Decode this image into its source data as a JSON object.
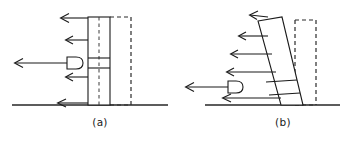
{
  "figure": {
    "background_color": "#ffffff",
    "line_color": "#1a1a1a",
    "width": 360,
    "height": 147
  },
  "panels": [
    {
      "id": "a",
      "caption": "(a)",
      "caption_x": 100,
      "caption_y": 126,
      "state_label": "undeformed",
      "ground": {
        "x1": 12,
        "x2": 168,
        "y": 105
      },
      "column": {
        "left": 88,
        "right": 110,
        "top": 17,
        "bottom": 105,
        "centerline_x": 99,
        "centerline_dashed": true
      },
      "reference_outline": {
        "left": 110,
        "right": 131,
        "top": 17,
        "bottom": 105,
        "dashed": true
      },
      "band": {
        "y_top": 58,
        "y_bottom": 68
      },
      "jack": {
        "x_flat": 67,
        "x_tip": 82,
        "y_center": 63,
        "half_height": 6
      },
      "arrows": [
        {
          "label": "load-arrow-1",
          "x_tail": 88,
          "x_head": 61,
          "y": 18
        },
        {
          "label": "load-arrow-2",
          "x_tail": 88,
          "x_head": 66,
          "y": 40
        },
        {
          "label": "jack-reaction-arrow",
          "x_tail": 67,
          "x_head": 14,
          "y": 63
        },
        {
          "label": "load-arrow-3",
          "x_tail": 88,
          "x_head": 66,
          "y": 77
        },
        {
          "label": "base-shear-arrow",
          "x_tail": 88,
          "x_head": 57,
          "y": 103
        }
      ]
    },
    {
      "id": "b",
      "caption": "(b)",
      "caption_x": 283,
      "caption_y": 126,
      "state_label": "deformed",
      "ground": {
        "x1": 205,
        "x2": 340,
        "y": 105
      },
      "column": {
        "top_left_x": 258,
        "top_right_x": 282,
        "top_y": 19,
        "base_left_x": 281,
        "base_right_x": 303,
        "base_y": 105,
        "tilt_direction": "leaning-left-at-top"
      },
      "reference_outline": {
        "left": 295,
        "right": 316,
        "top": 20,
        "bottom": 105,
        "dashed": true
      },
      "band": {
        "y_top": 82,
        "y_bottom": 95
      },
      "jack": {
        "x_flat": 228,
        "x_tip": 243,
        "y_center": 87,
        "half_height": 6
      },
      "arrows": [
        {
          "label": "load-arrow-1",
          "x_tail": 268,
          "x_head": 249,
          "y": 15
        },
        {
          "label": "load-arrow-2",
          "x_tail": 268,
          "x_head": 238,
          "y": 36
        },
        {
          "label": "load-arrow-3",
          "x_tail": 272,
          "x_head": 230,
          "y": 54
        },
        {
          "label": "load-arrow-4",
          "x_tail": 276,
          "x_head": 226,
          "y": 72
        },
        {
          "label": "jack-reaction-arrow",
          "x_tail": 228,
          "x_head": 185,
          "y": 87
        },
        {
          "label": "base-shear-arrow",
          "x_tail": 280,
          "x_head": 222,
          "y": 98
        }
      ]
    }
  ]
}
